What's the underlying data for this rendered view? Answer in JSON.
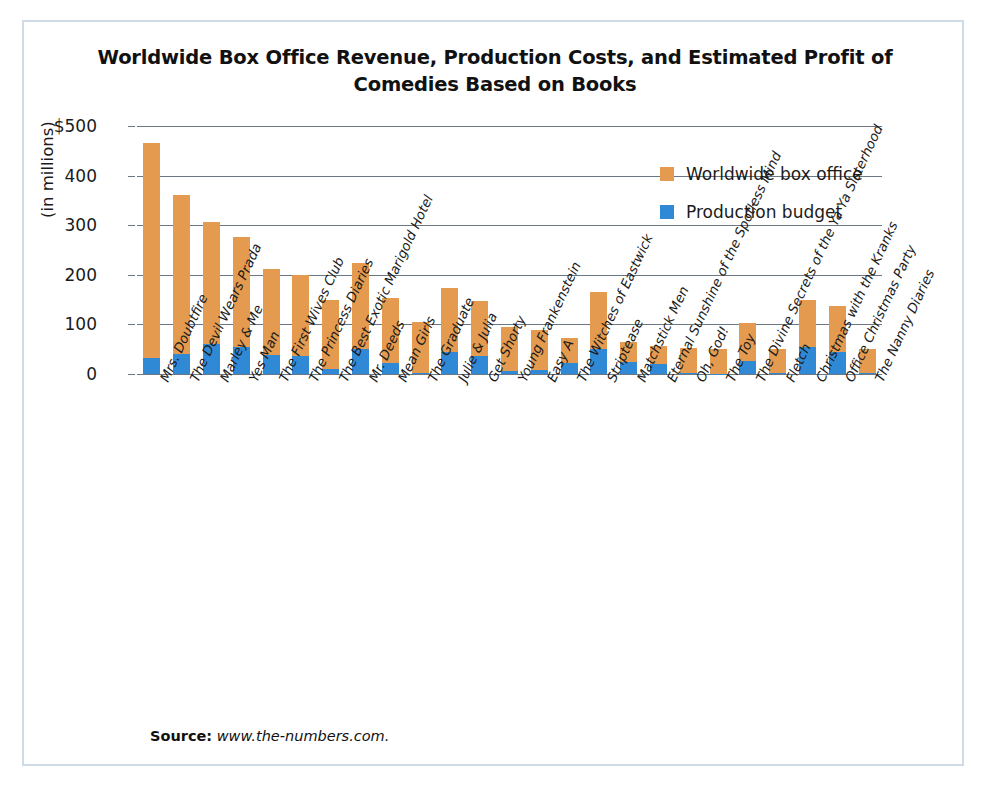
{
  "figure": {
    "title": "Worldwide Box Office Revenue, Production Costs, and Estimated Profit of Comedies Based on Books",
    "source_label": "Source:",
    "source_url": "www.the-numbers.com.",
    "frame_color": "#cfdce8"
  },
  "legend": {
    "position": "top-right",
    "entries": [
      {
        "label": "Worldwide box office",
        "color": "#E49A4F",
        "icon": "orange-square-swatch"
      },
      {
        "label": "Production budget",
        "color": "#2F89D4",
        "icon": "blue-square-swatch"
      }
    ]
  },
  "axes": {
    "y_title": "(in millions)",
    "y_ticks": [
      "$500",
      "400",
      "300",
      "200",
      "100",
      "0"
    ],
    "y_tick_values": [
      500,
      400,
      300,
      200,
      100,
      0
    ],
    "y_min": 0,
    "y_max": 500,
    "grid": true
  },
  "chart_data": {
    "type": "bar",
    "stacked": true,
    "title": "Worldwide Box Office Revenue, Production Costs, and Estimated Profit of Comedies Based on Books",
    "xlabel": "",
    "ylabel": "(in millions)",
    "ylim": [
      0,
      500
    ],
    "categories": [
      "Mrs. Doubtfire",
      "The Devil Wears Prada",
      "Marley & Me",
      "Yes Man",
      "The First Wives Club",
      "The Princess Diaries",
      "The Best Exotic Marigold Hotel",
      "Mr. Deeds",
      "Mean Girls",
      "The Graduate",
      "Julie & Julia",
      "Get Shorty",
      "Young Frankenstein",
      "Easy A",
      "The Witches of Eastwick",
      "Striptease",
      "Matchstick Men",
      "Eternal Sunshine of the Spotless Mind",
      "Oh, God!",
      "The Toy",
      "The Divine Secrets of the Ya Ya Sisterhood",
      "Fletch",
      "Christmas with the Kranks",
      "Office Christmas Party",
      "The Nanny Diaries"
    ],
    "series": [
      {
        "name": "Production budget",
        "color": "#2F89D4",
        "values": [
          33,
          41,
          60,
          55,
          38,
          37,
          10,
          50,
          23,
          3,
          44,
          36,
          7,
          8,
          22,
          50,
          25,
          20,
          2,
          1,
          27,
          2,
          55,
          45,
          2
        ]
      },
      {
        "name": "Worldwide box office",
        "color": "#E49A4F",
        "values": [
          466,
          360,
          307,
          277,
          212,
          200,
          150,
          223,
          153,
          105,
          174,
          147,
          95,
          89,
          72,
          166,
          65,
          57,
          52,
          50,
          103,
          50,
          150,
          138,
          50
        ]
      }
    ]
  }
}
